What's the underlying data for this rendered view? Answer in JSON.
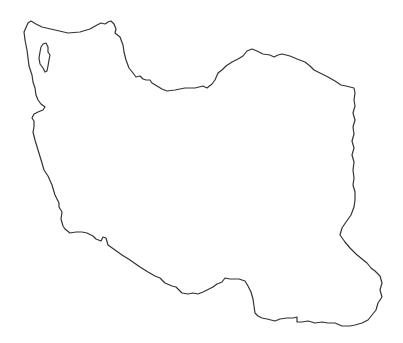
{
  "map": {
    "subject": "Outline map of Iran",
    "style": "blank outline",
    "background_color": "#ffffff",
    "stroke_color": "#333333",
    "features": [
      {
        "name": "country-border",
        "type": "outline"
      },
      {
        "name": "lake-urmia",
        "type": "lake outline"
      }
    ]
  }
}
